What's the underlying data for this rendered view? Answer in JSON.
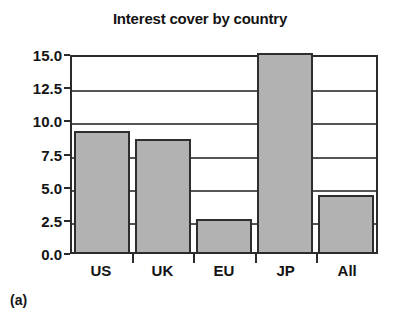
{
  "chart_data": {
    "type": "bar",
    "title": "Interest cover by country",
    "categories": [
      "US",
      "UK",
      "EU",
      "JP",
      "All"
    ],
    "values": [
      9.1,
      8.5,
      2.5,
      15.0,
      4.3
    ],
    "xlabel": "",
    "ylabel": "",
    "ylim": [
      0.0,
      15.0
    ],
    "ytick_labels": [
      "15.0",
      "12.5",
      "10.0",
      "7.5",
      "5.0",
      "2.5",
      "0.0"
    ],
    "ytick_values": [
      15.0,
      12.5,
      10.0,
      7.5,
      5.0,
      2.5,
      0.0
    ],
    "grid": true,
    "legend": "none",
    "bar_fill_color": "#b2b2b2",
    "bar_edge_color": "#2e2e2e",
    "axis_color": "#2b2b2b",
    "gridline_color": "#555555",
    "background_color": "#ffffff"
  },
  "caption": {
    "panel_label": "(a)"
  }
}
